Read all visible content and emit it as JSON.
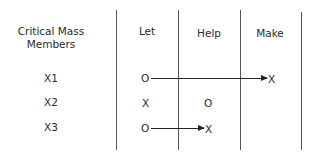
{
  "diagram": {
    "headers": {
      "members_line1": "Critical Mass",
      "members_line2": "Members",
      "let": "Let",
      "help": "Help",
      "make": "Make"
    },
    "rows": [
      {
        "member": "X1",
        "let": "O",
        "help": "",
        "make": "X",
        "arrow": "let-to-make"
      },
      {
        "member": "X2",
        "let": "X",
        "help": "O",
        "make": "",
        "arrow": ""
      },
      {
        "member": "X3",
        "let": "O",
        "help": "X",
        "make": "",
        "arrow": "let-to-help"
      }
    ]
  }
}
